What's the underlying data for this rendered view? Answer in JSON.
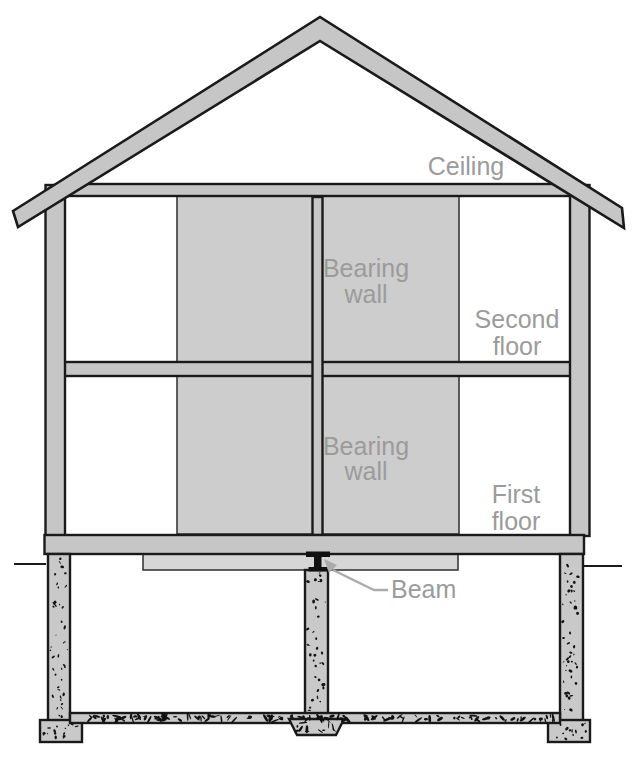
{
  "diagram": {
    "labels": {
      "ceiling": "Ceiling",
      "bearing_wall_upper": {
        "line1": "Bearing",
        "line2": "wall"
      },
      "second_floor": {
        "line1": "Second",
        "line2": "floor"
      },
      "bearing_wall_lower": {
        "line1": "Bearing",
        "line2": "wall"
      },
      "first_floor": {
        "line1": "First",
        "line2": "floor"
      },
      "beam": "Beam"
    },
    "colors": {
      "structure_gray": "#c6c6c6",
      "shaded_region_gray": "#cdcdcd",
      "shaded_region_light": "#d6d6d6",
      "concrete_gray": "#c9c9c9",
      "label_gray": "#9b9b9b",
      "arrow_gray": "#ababab",
      "beam_steel": "#111111",
      "outline_black": "#1a1a1a",
      "background": "#ffffff"
    }
  }
}
